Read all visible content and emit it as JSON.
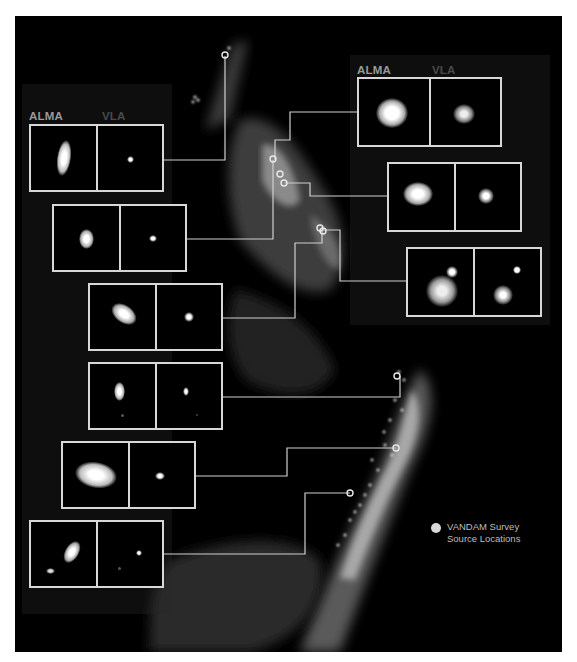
{
  "figure": {
    "background": "#000000",
    "line_color": "#cfcfcf",
    "column_labels": {
      "alma": "ALMA",
      "vla": "VLA"
    },
    "legend": {
      "marker": "filled-circle",
      "line1": "VANDAM Survey",
      "line2": "Source Locations"
    },
    "panels": [
      {
        "id": "left-1",
        "alma_desc": "elongated vertical ellipse",
        "vla_desc": "small point source"
      },
      {
        "id": "left-2",
        "alma_desc": "compact oval source",
        "vla_desc": "small compact source"
      },
      {
        "id": "left-3",
        "alma_desc": "tilted ellipse",
        "vla_desc": "compact source"
      },
      {
        "id": "left-4",
        "alma_desc": "vertical oval with faint companion",
        "vla_desc": "small source with faint companion"
      },
      {
        "id": "left-5",
        "alma_desc": "large horizontal ellipse",
        "vla_desc": "compact source"
      },
      {
        "id": "left-6",
        "alma_desc": "binary elongated sources",
        "vla_desc": "small point with faint companion"
      },
      {
        "id": "right-1",
        "alma_desc": "large round source",
        "vla_desc": "irregular clumpy source"
      },
      {
        "id": "right-2",
        "alma_desc": "irregular rounded source",
        "vla_desc": "irregular compact source"
      },
      {
        "id": "right-3",
        "alma_desc": "binary source with bright companion",
        "vla_desc": "point plus irregular source"
      }
    ]
  }
}
